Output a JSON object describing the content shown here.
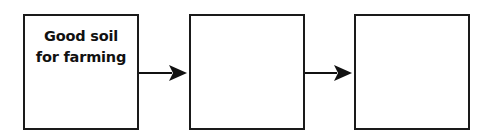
{
  "diagram": {
    "type": "flow-chain",
    "boxes": [
      {
        "label_line1": "Good soil",
        "label_line2": "for farming"
      },
      {
        "label_line1": "",
        "label_line2": ""
      },
      {
        "label_line1": "",
        "label_line2": ""
      }
    ],
    "arrows": [
      {
        "from": 0,
        "to": 1
      },
      {
        "from": 1,
        "to": 2
      }
    ],
    "colors": {
      "stroke": "#1a1a1a",
      "background": "#ffffff"
    }
  }
}
